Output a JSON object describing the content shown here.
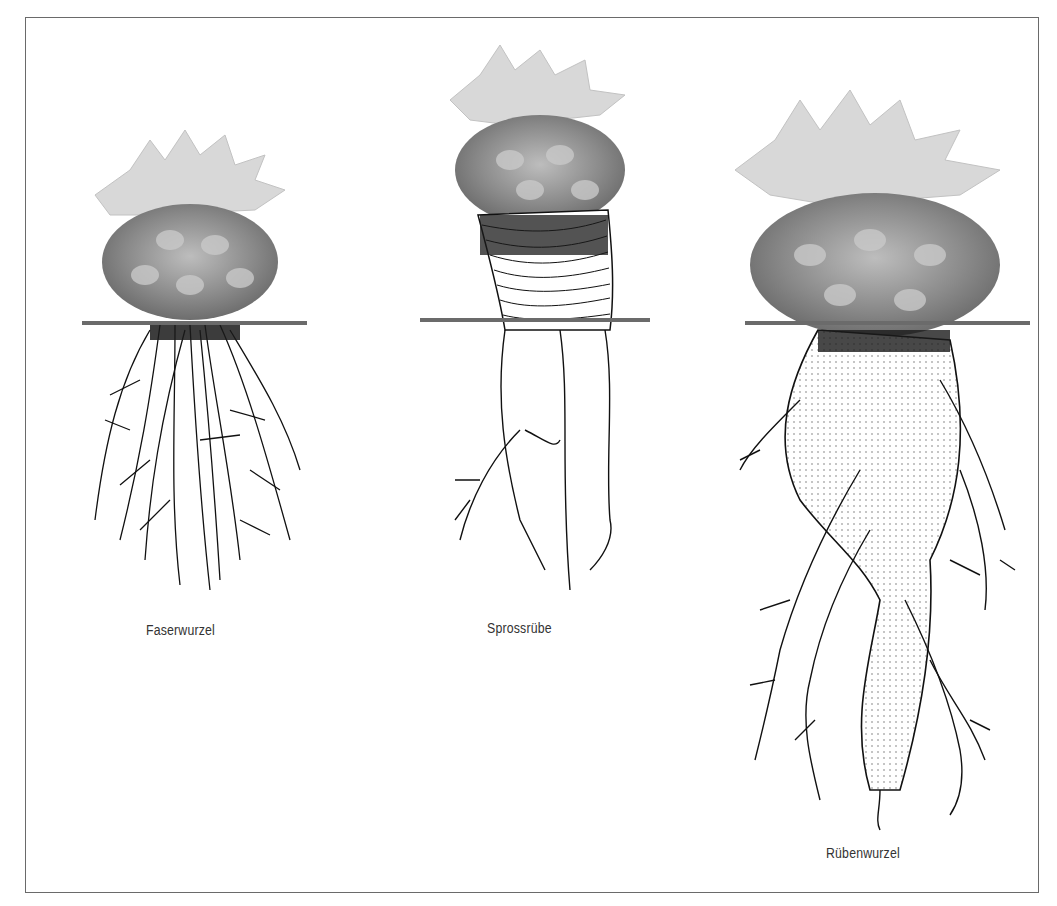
{
  "figure": {
    "title": "",
    "panels": [
      {
        "id": "faserwurzel",
        "label": "Faserwurzel",
        "description": "Cactus with fibrous root system"
      },
      {
        "id": "sprossruebe",
        "label": "Sprossrübe",
        "description": "Cactus with shoot tuber"
      },
      {
        "id": "ruebenwurzel",
        "label": "Rübenwurzel",
        "description": "Cactus with taproot tuber"
      }
    ],
    "ground_line_color": "#6b6b6b",
    "frame_color": "#6a6a6a"
  }
}
